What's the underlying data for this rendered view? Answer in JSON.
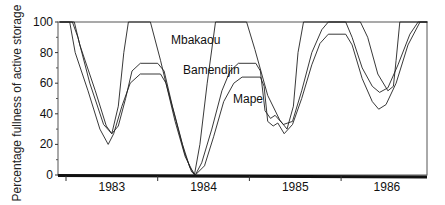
{
  "chart_data": {
    "type": "line",
    "title": "",
    "xlabel": "",
    "ylabel": "Percentage fullness of active storage",
    "ylim": [
      0,
      100
    ],
    "xlim": [
      1982.93,
      1986.94
    ],
    "grid": false,
    "legend": "inline labels",
    "yticks": [
      "0",
      "20",
      "40",
      "60",
      "80",
      "100"
    ],
    "xtick_labels": [
      "1983",
      "1984",
      "1985",
      "1986"
    ],
    "year_boundaries": [
      1983,
      1984,
      1985,
      1986
    ],
    "series": [
      {
        "name": "Mbakaou",
        "label_pos": {
          "x": 171,
          "y": 33
        },
        "points": [
          [
            1982.93,
            100
          ],
          [
            1983.07,
            100
          ],
          [
            1983.13,
            90
          ],
          [
            1983.26,
            60
          ],
          [
            1983.41,
            33
          ],
          [
            1983.5,
            27
          ],
          [
            1983.57,
            45
          ],
          [
            1983.63,
            80
          ],
          [
            1983.68,
            100
          ],
          [
            1983.92,
            100
          ],
          [
            1984.03,
            75
          ],
          [
            1984.19,
            35
          ],
          [
            1984.3,
            12
          ],
          [
            1984.4,
            0
          ],
          [
            1984.46,
            20
          ],
          [
            1984.54,
            60
          ],
          [
            1984.63,
            100
          ],
          [
            1984.97,
            100
          ],
          [
            1985.06,
            82
          ],
          [
            1985.2,
            52
          ],
          [
            1985.33,
            36
          ],
          [
            1985.41,
            30
          ],
          [
            1985.48,
            45
          ],
          [
            1985.53,
            80
          ],
          [
            1985.59,
            100
          ],
          [
            1986.21,
            100
          ],
          [
            1986.29,
            90
          ],
          [
            1986.4,
            66
          ],
          [
            1986.51,
            55
          ],
          [
            1986.57,
            58
          ],
          [
            1986.6,
            75
          ],
          [
            1986.64,
            100
          ],
          [
            1986.94,
            100
          ]
        ]
      },
      {
        "name": "Bamendjin",
        "label_pos": {
          "x": 183,
          "y": 63
        },
        "points": [
          [
            1982.93,
            100
          ],
          [
            1983.09,
            100
          ],
          [
            1983.15,
            85
          ],
          [
            1983.32,
            55
          ],
          [
            1983.44,
            32
          ],
          [
            1983.5,
            27
          ],
          [
            1983.57,
            32
          ],
          [
            1983.65,
            50
          ],
          [
            1983.72,
            68
          ],
          [
            1983.81,
            73
          ],
          [
            1984.0,
            73
          ],
          [
            1984.07,
            68
          ],
          [
            1984.16,
            45
          ],
          [
            1984.27,
            20
          ],
          [
            1984.35,
            5
          ],
          [
            1984.41,
            0
          ],
          [
            1984.48,
            8
          ],
          [
            1984.59,
            30
          ],
          [
            1984.7,
            55
          ],
          [
            1984.79,
            68
          ],
          [
            1984.88,
            73
          ],
          [
            1985.07,
            73
          ],
          [
            1985.12,
            68
          ],
          [
            1985.17,
            42
          ],
          [
            1985.23,
            37
          ],
          [
            1985.28,
            39
          ],
          [
            1985.37,
            33
          ],
          [
            1985.47,
            35
          ],
          [
            1985.57,
            55
          ],
          [
            1985.68,
            80
          ],
          [
            1985.79,
            95
          ],
          [
            1985.86,
            100
          ],
          [
            1986.05,
            100
          ],
          [
            1986.12,
            90
          ],
          [
            1986.23,
            70
          ],
          [
            1986.34,
            58
          ],
          [
            1986.42,
            54
          ],
          [
            1986.51,
            57
          ],
          [
            1986.62,
            72
          ],
          [
            1986.75,
            92
          ],
          [
            1986.84,
            100
          ],
          [
            1986.94,
            100
          ]
        ]
      },
      {
        "name": "Mape",
        "label_pos": {
          "x": 233,
          "y": 92
        },
        "points": [
          [
            1982.93,
            100
          ],
          [
            1983.04,
            100
          ],
          [
            1983.1,
            80
          ],
          [
            1983.24,
            55
          ],
          [
            1983.37,
            30
          ],
          [
            1983.46,
            20
          ],
          [
            1983.52,
            27
          ],
          [
            1983.61,
            45
          ],
          [
            1983.7,
            60
          ],
          [
            1983.81,
            66
          ],
          [
            1984.03,
            66
          ],
          [
            1984.09,
            60
          ],
          [
            1984.18,
            40
          ],
          [
            1984.29,
            15
          ],
          [
            1984.37,
            2
          ],
          [
            1984.41,
            0
          ],
          [
            1984.51,
            6
          ],
          [
            1984.61,
            25
          ],
          [
            1984.72,
            48
          ],
          [
            1984.83,
            60
          ],
          [
            1984.92,
            64
          ],
          [
            1985.12,
            64
          ],
          [
            1985.16,
            58
          ],
          [
            1985.2,
            35
          ],
          [
            1985.26,
            32
          ],
          [
            1985.31,
            34
          ],
          [
            1985.38,
            27
          ],
          [
            1985.47,
            33
          ],
          [
            1985.57,
            50
          ],
          [
            1985.68,
            72
          ],
          [
            1985.77,
            86
          ],
          [
            1985.86,
            92
          ],
          [
            1986.05,
            92
          ],
          [
            1986.12,
            85
          ],
          [
            1986.23,
            63
          ],
          [
            1986.34,
            48
          ],
          [
            1986.41,
            43
          ],
          [
            1986.49,
            46
          ],
          [
            1986.6,
            60
          ],
          [
            1986.73,
            85
          ],
          [
            1986.86,
            100
          ],
          [
            1986.94,
            100
          ]
        ]
      }
    ]
  }
}
